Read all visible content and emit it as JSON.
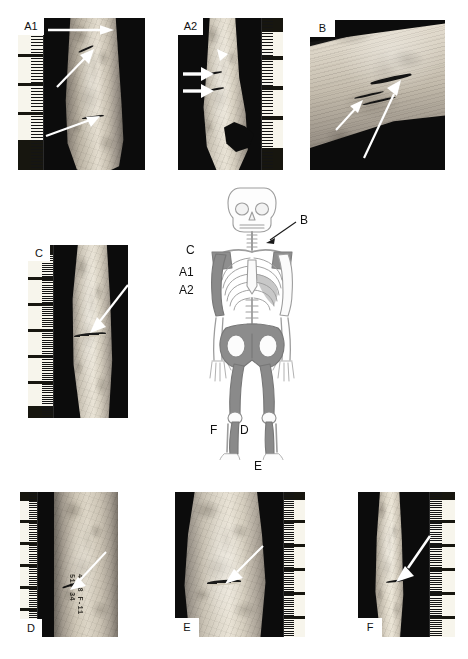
{
  "figure": {
    "type": "multi-panel forensic osteology plate",
    "background_color": "#ffffff"
  },
  "panels": [
    {
      "id": "A1",
      "label": "A1",
      "label_position": "top-left",
      "specimen": "distal humerus with extensive cortical damage",
      "ruler_side": "left",
      "ruler_unit": "cm",
      "arrow_count": 3,
      "arrows": [
        {
          "name": "arrow-top",
          "direction": "left-to-right",
          "target": "upper cortical defect"
        },
        {
          "name": "arrow-middle",
          "direction": "lower-left-to-upper-right",
          "target": "mid-shaft cut mark"
        },
        {
          "name": "arrow-lower",
          "direction": "left-to-right",
          "target": "distal metaphyseal damage"
        }
      ]
    },
    {
      "id": "A2",
      "label": "A2",
      "label_position": "top-left",
      "specimen": "distal humerus, opposing view with breakage",
      "ruler_side": "right",
      "ruler_unit": "cm",
      "arrow_count": 3,
      "arrows": [
        {
          "name": "arrow-upper-small",
          "direction": "down-right",
          "target": "small surface defect"
        },
        {
          "name": "arrow-middle",
          "direction": "left-to-right",
          "target": "cut mark on medial border"
        },
        {
          "name": "arrow-lower",
          "direction": "left-to-right",
          "target": "second cut mark"
        }
      ]
    },
    {
      "id": "B",
      "label": "B",
      "label_position": "top-left",
      "specimen": "rib fragment, oblique close-up of incisions",
      "ruler_side": "none",
      "arrow_count": 2,
      "arrows": [
        {
          "name": "arrow-short",
          "direction": "up-right",
          "target": "shallow striation"
        },
        {
          "name": "arrow-long",
          "direction": "up-right",
          "target": "deep V-shaped cut mark"
        }
      ]
    },
    {
      "id": "C",
      "label": "C",
      "label_position": "top-left",
      "specimen": "humerus shaft with single incision",
      "ruler_side": "left",
      "ruler_unit": "cm",
      "arrow_count": 1,
      "arrows": [
        {
          "name": "arrow-diagonal",
          "direction": "upper-right-to-lower-left",
          "target": "transverse cut mark"
        }
      ]
    },
    {
      "id": "D",
      "label": "D",
      "label_position": "bottom-left",
      "specimen": "femur shaft with fine incision and inked catalogue number",
      "ruler_side": "left",
      "ruler_unit": "cm",
      "arrow_count": 1,
      "arrows": [
        {
          "name": "arrow-diagonal",
          "direction": "upper-right-to-lower-left",
          "target": "fine cut mark"
        }
      ],
      "specimen_marking": "4 18 F-11\n513 34"
    },
    {
      "id": "E",
      "label": "E",
      "label_position": "bottom-left",
      "specimen": "tibia shaft with chop mark",
      "ruler_side": "right",
      "ruler_unit": "cm",
      "arrow_count": 1,
      "arrows": [
        {
          "name": "arrow-diagonal",
          "direction": "upper-right-to-lower-left",
          "target": "chop mark with raised margin"
        }
      ]
    },
    {
      "id": "F",
      "label": "F",
      "label_position": "bottom-left",
      "specimen": "tibia shaft, narrow view with incision",
      "ruler_side": "right",
      "ruler_unit": "cm",
      "arrow_count": 1,
      "arrows": [
        {
          "name": "arrow-diagonal",
          "direction": "upper-right-to-lower-left",
          "target": "incision on anterior crest"
        }
      ]
    }
  ],
  "skeleton": {
    "name": "human-skeleton-anterior-diagram",
    "view": "anterior",
    "line_color": "#9a9a9a",
    "shade_color": "#8c8c8c",
    "shaded_elements": [
      "left humerus",
      "right scapula region",
      "pelvis",
      "left femur",
      "right femur",
      "left tibia",
      "right tibia"
    ],
    "callouts": [
      {
        "label": "C",
        "points_to": "left humerus proximal shaft",
        "has_leader": false
      },
      {
        "label": "A1",
        "points_to": "left humerus distal shaft",
        "has_leader": false
      },
      {
        "label": "A2",
        "points_to": "left humerus distal end",
        "has_leader": false
      },
      {
        "label": "B",
        "points_to": "right ribs",
        "has_leader": true
      },
      {
        "label": "F",
        "points_to": "left tibia proximal",
        "has_leader": false
      },
      {
        "label": "D",
        "points_to": "left tibia / fibula",
        "has_leader": false
      },
      {
        "label": "E",
        "points_to": "right tibia distal",
        "has_leader": false
      }
    ]
  }
}
